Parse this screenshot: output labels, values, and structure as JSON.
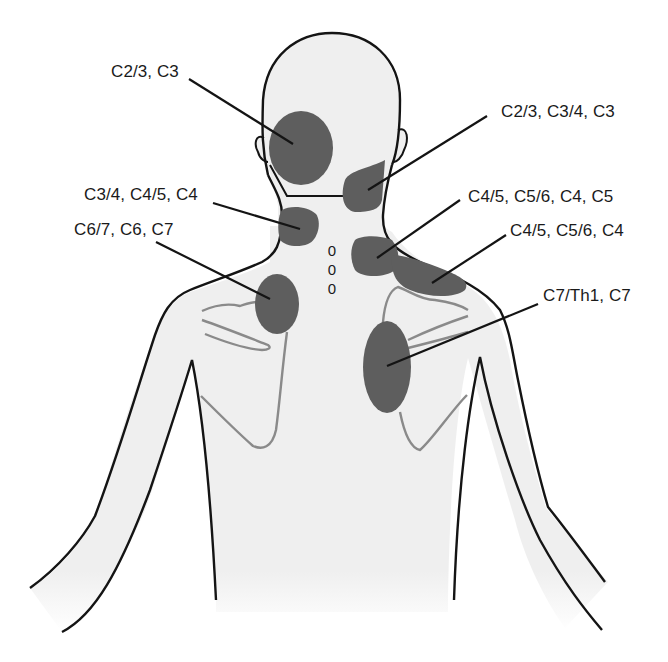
{
  "figure": {
    "colors": {
      "background": "#ffffff",
      "body_fill": "#efefef",
      "outline": "#141414",
      "scapula": "#8a8a8a",
      "pain_zone": "#5e5e5e",
      "leader": "#141414",
      "text": "#1a1a1a"
    },
    "spinous_process_marks": [
      "0",
      "0",
      "0"
    ]
  },
  "labels": [
    {
      "id": "c23-c3",
      "text": "C2/3, C3"
    },
    {
      "id": "c23-c34-c3",
      "text": "C2/3, C3/4, C3"
    },
    {
      "id": "c34-c45-c4",
      "text": "C3/4, C4/5, C4"
    },
    {
      "id": "c45-c56-c4-c5",
      "text": "C4/5, C5/6, C4, C5"
    },
    {
      "id": "c67-c6-c7",
      "text": "C6/7, C6, C7"
    },
    {
      "id": "c45-c56-c4",
      "text": "C4/5, C5/6, C4"
    },
    {
      "id": "c7th1-c7",
      "text": "C7/Th1, C7"
    }
  ],
  "pain_zones": [
    {
      "id": "occipital-left",
      "label_ref": "C2/3, C3"
    },
    {
      "id": "upper-neck-right",
      "label_ref": "C2/3, C3/4, C3"
    },
    {
      "id": "mid-neck-left",
      "label_ref": "C3/4, C4/5, C4"
    },
    {
      "id": "lower-neck-right",
      "label_ref": "C4/5, C5/6, C4, C5"
    },
    {
      "id": "shoulder-top-right",
      "label_ref": "C4/5, C5/6, C4"
    },
    {
      "id": "scapula-upper-left",
      "label_ref": "C6/7, C6, C7"
    },
    {
      "id": "scapula-medial-right",
      "label_ref": "C7/Th1, C7"
    }
  ]
}
